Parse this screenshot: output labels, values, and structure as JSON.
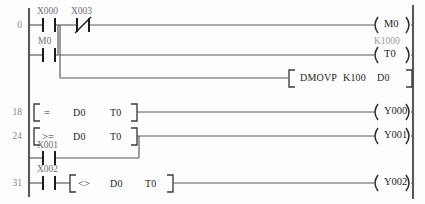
{
  "diagram": {
    "type": "ladder-logic",
    "left_rail": "power-rail-left",
    "right_rail": "power-rail-right"
  },
  "rungs": [
    {
      "step": "0",
      "contacts": [
        {
          "name": "X000",
          "kind": "normally-open"
        },
        {
          "name": "X003",
          "kind": "normally-closed"
        }
      ],
      "coil": {
        "name": "M0",
        "preset": ""
      }
    },
    {
      "step": "",
      "contacts": [
        {
          "name": "M0",
          "kind": "normally-open"
        }
      ],
      "coil": {
        "name": "T0",
        "preset": "K1000"
      }
    },
    {
      "step": "",
      "contacts": [],
      "instruction": {
        "op": "DMOVP",
        "arg1": "K100",
        "arg2": "D0"
      }
    },
    {
      "step": "18",
      "compare": {
        "op": "=",
        "arg1": "D0",
        "arg2": "T0"
      },
      "coil": {
        "name": "Y000",
        "preset": ""
      }
    },
    {
      "step": "24",
      "compare": {
        "op": ">=",
        "arg1": "D0",
        "arg2": "T0"
      },
      "coil": {
        "name": "Y001",
        "preset": ""
      }
    },
    {
      "step": "",
      "contacts": [
        {
          "name": "X001",
          "kind": "normally-open"
        }
      ],
      "branch_of": "24"
    },
    {
      "step": "31",
      "contacts": [
        {
          "name": "X002",
          "kind": "normally-open"
        }
      ],
      "compare": {
        "op": "<>",
        "arg1": "D0",
        "arg2": "T0"
      },
      "coil": {
        "name": "Y002",
        "preset": ""
      }
    }
  ],
  "colors": {
    "rail": "#58585c",
    "wire": "#58585c",
    "contact": "#1d1d20",
    "text": "#1f1f23",
    "muted": "#86868a",
    "preset": "#9a9a9f",
    "background": "#fdfdfd"
  }
}
